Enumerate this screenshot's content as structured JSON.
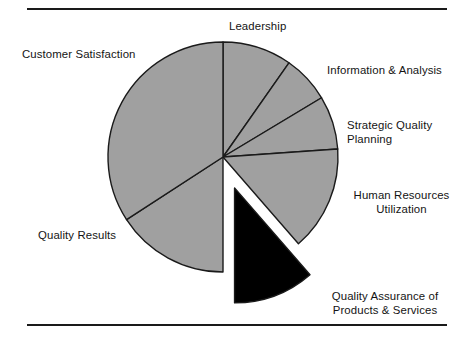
{
  "figure": {
    "background_color": "#ffffff",
    "rule_color": "#1a1a1a",
    "top_rule": "",
    "bottom_rule": ""
  },
  "chart_data": {
    "type": "pie",
    "title": "",
    "subtitle": "",
    "xlabel": "",
    "ylabel": "",
    "legend_position": "none",
    "grid": false,
    "units": "percent",
    "center": [
      223,
      157
    ],
    "radius": 115,
    "start_angle_deg": 0,
    "direction": "clockwise",
    "categories": [
      "Leadership",
      "Information & Analysis",
      "Strategic Quality Planning",
      "Human Resources Utilization",
      "Quality Assurance of Products & Services",
      "Quality Results",
      "Customer Satisfaction"
    ],
    "values": [
      9.7,
      6.7,
      7.5,
      14.7,
      11.4,
      15.8,
      34.2
    ],
    "slices": [
      {
        "name": "Leadership",
        "label_lines": [
          "Leadership"
        ],
        "value": 9.7,
        "start_deg": 0,
        "end_deg": 35,
        "color": "#a0a0a0",
        "exploded": false
      },
      {
        "name": "Information & Analysis",
        "label_lines": [
          "Information & Analysis"
        ],
        "value": 6.7,
        "start_deg": 35,
        "end_deg": 59,
        "color": "#a0a0a0",
        "exploded": false
      },
      {
        "name": "Strategic Quality Planning",
        "label_lines": [
          "Strategic Quality",
          "Planning"
        ],
        "value": 7.5,
        "start_deg": 59,
        "end_deg": 86,
        "color": "#a0a0a0",
        "exploded": false
      },
      {
        "name": "Human Resources Utilization",
        "label_lines": [
          "Human Resources",
          "Utilization"
        ],
        "value": 14.7,
        "start_deg": 86,
        "end_deg": 139,
        "color": "#a0a0a0",
        "exploded": false
      },
      {
        "name": "Quality Assurance of Products & Services",
        "label_lines": [
          "Quality Assurance of",
          "Products & Services"
        ],
        "value": 11.4,
        "start_deg": 139,
        "end_deg": 180,
        "color": "#000000",
        "exploded": true,
        "explode_offset": 33
      },
      {
        "name": "Quality Results",
        "label_lines": [
          "Quality Results"
        ],
        "value": 15.8,
        "start_deg": 180,
        "end_deg": 237,
        "color": "#a0a0a0",
        "exploded": false
      },
      {
        "name": "Customer Satisfaction",
        "label_lines": [
          "Customer Satisfaction"
        ],
        "value": 34.2,
        "start_deg": 237,
        "end_deg": 360,
        "color": "#a0a0a0",
        "exploded": false
      }
    ],
    "stroke_color": "#1a1a1a",
    "stroke_width": 1.4
  },
  "labels": {
    "leadership": "Leadership",
    "customer_satisfaction": "Customer Satisfaction",
    "information_analysis": "Information & Analysis",
    "strategic_quality_planning": "Strategic Quality\nPlanning",
    "human_resources_utilization": "Human Resources\nUtilization",
    "quality_assurance": "Quality Assurance of\nProducts & Services",
    "quality_results": "Quality Results"
  }
}
